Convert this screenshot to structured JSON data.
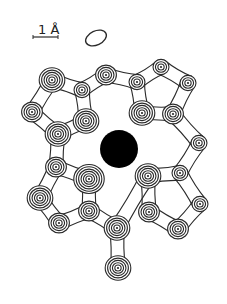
{
  "figure": {
    "type": "electron-density-contour-map",
    "scale_bar": {
      "label": "1 Å",
      "length_angstrom": 1
    },
    "colors": {
      "line": "#2a2a2a",
      "central_atom": "#000000",
      "background": "#ffffff"
    },
    "central_atom": {
      "label": "heavy-atom"
    },
    "peaks": [
      {
        "id": "p1",
        "x": 52,
        "y": 80,
        "rings": 5
      },
      {
        "id": "p2",
        "x": 32,
        "y": 112,
        "rings": 4
      },
      {
        "id": "p3",
        "x": 58,
        "y": 134,
        "rings": 5
      },
      {
        "id": "p4",
        "x": 82,
        "y": 90,
        "rings": 3
      },
      {
        "id": "p5",
        "x": 86,
        "y": 121,
        "rings": 5
      },
      {
        "id": "p6",
        "x": 106,
        "y": 75,
        "rings": 4
      },
      {
        "id": "p7",
        "x": 137,
        "y": 82,
        "rings": 3
      },
      {
        "id": "p8",
        "x": 161,
        "y": 67,
        "rings": 3
      },
      {
        "id": "p9",
        "x": 188,
        "y": 83,
        "rings": 3
      },
      {
        "id": "p10",
        "x": 142,
        "y": 113,
        "rings": 5
      },
      {
        "id": "p11",
        "x": 173,
        "y": 114,
        "rings": 4
      },
      {
        "id": "p12",
        "x": 199,
        "y": 143,
        "rings": 3
      },
      {
        "id": "p13",
        "x": 56,
        "y": 167,
        "rings": 4
      },
      {
        "id": "p14",
        "x": 89,
        "y": 179,
        "rings": 6
      },
      {
        "id": "p15",
        "x": 40,
        "y": 198,
        "rings": 5
      },
      {
        "id": "p16",
        "x": 59,
        "y": 223,
        "rings": 4
      },
      {
        "id": "p17",
        "x": 89,
        "y": 211,
        "rings": 4
      },
      {
        "id": "p18",
        "x": 117,
        "y": 228,
        "rings": 5
      },
      {
        "id": "p19",
        "x": 148,
        "y": 176,
        "rings": 5
      },
      {
        "id": "p20",
        "x": 180,
        "y": 173,
        "rings": 3
      },
      {
        "id": "p21",
        "x": 149,
        "y": 212,
        "rings": 4
      },
      {
        "id": "p22",
        "x": 178,
        "y": 229,
        "rings": 4
      },
      {
        "id": "p23",
        "x": 200,
        "y": 204,
        "rings": 3
      },
      {
        "id": "p24",
        "x": 118,
        "y": 268,
        "rings": 5
      }
    ]
  }
}
